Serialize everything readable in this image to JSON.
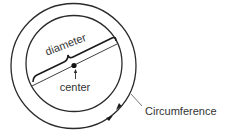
{
  "diagram": {
    "labels": {
      "diameter": "diameter",
      "center": "center",
      "circumference": "Circumference"
    },
    "colors": {
      "stroke": "#2a2a2a",
      "text": "#333333",
      "background": "#ffffff"
    }
  }
}
